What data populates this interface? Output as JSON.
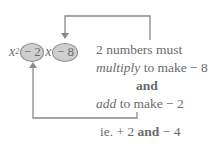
{
  "expression": {
    "var": "x",
    "power": "2",
    "term1": "− 2",
    "var2": "x",
    "term2": "− 8"
  },
  "explanation": {
    "line1": "2 numbers must",
    "line2_italic": "multiply",
    "line2_rest": " to make − 8",
    "line3": "and",
    "line4_italic": "add",
    "line4_rest": " to make − 2",
    "answer_prefix": "ie. + 2 ",
    "answer_and": "and",
    "answer_suffix": " − 4"
  },
  "colors": {
    "oval_fill": "#cfcfcf",
    "oval_border": "#8a8a8a",
    "line": "#8a8a8a",
    "text": "#6a6a6a"
  }
}
